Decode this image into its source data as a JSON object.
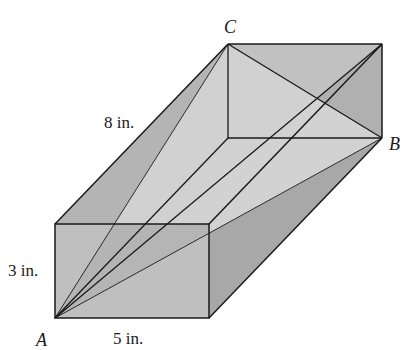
{
  "figure": {
    "type": "rectangular box with space diagonals",
    "labels": {
      "vertex_a": "A",
      "vertex_b": "B",
      "vertex_c": "C",
      "length": "5 in.",
      "height": "3 in.",
      "depth": "8 in."
    },
    "dimensions": {
      "length_in": 5,
      "height_in": 3,
      "depth_in": 8
    },
    "colors": {
      "dark_face": "#a9a9a9",
      "medium_face": "#bdbdbd",
      "light_plane": "#d6d6d6",
      "edge": "#1a1a1a"
    }
  }
}
